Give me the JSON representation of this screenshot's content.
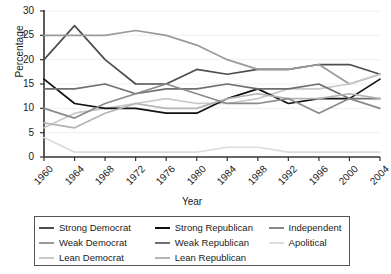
{
  "chart_data": {
    "type": "line",
    "title": "",
    "xlabel": "Year",
    "ylabel": "Percentage",
    "grid": true,
    "legend_position": "bottom",
    "xlim": [
      1960,
      2004
    ],
    "ylim": [
      0,
      30
    ],
    "yticks": [
      "0",
      "5",
      "10",
      "15",
      "20",
      "25",
      "30"
    ],
    "x": [
      1960,
      1964,
      1968,
      1972,
      1976,
      1980,
      1984,
      1988,
      1992,
      1996,
      2000,
      2004
    ],
    "xticks": [
      "1960",
      "1964",
      "1968",
      "1972",
      "1976",
      "1980",
      "1984",
      "1988",
      "1992",
      "1996",
      "2000",
      "2004"
    ],
    "series": [
      {
        "name": "Strong Democrat",
        "color": "#4d4d4d",
        "values": [
          20.0,
          27.0,
          20.0,
          15.0,
          15.0,
          18.0,
          17.0,
          18.0,
          18.0,
          19.0,
          19.0,
          17.0
        ]
      },
      {
        "name": "Weak Democrat",
        "color": "#9a9a9a",
        "values": [
          25.0,
          25.0,
          25.0,
          26.0,
          25.0,
          23.0,
          20.0,
          18.0,
          18.0,
          19.0,
          15.0,
          17.0
        ]
      },
      {
        "name": "Lean Democrat",
        "color": "#c9c9c9",
        "values": [
          6.0,
          9.0,
          10.0,
          11.0,
          12.0,
          11.0,
          11.0,
          12.0,
          14.0,
          14.0,
          15.0,
          17.0
        ]
      },
      {
        "name": "Strong Republican",
        "color": "#111111",
        "values": [
          16.0,
          11.0,
          10.0,
          10.0,
          9.0,
          9.0,
          12.0,
          14.0,
          11.0,
          12.0,
          12.0,
          16.0
        ]
      },
      {
        "name": "Weak Republican",
        "color": "#6f6f6f",
        "values": [
          14.0,
          14.0,
          15.0,
          13.0,
          14.0,
          14.0,
          15.0,
          14.0,
          14.0,
          15.0,
          12.0,
          12.0
        ]
      },
      {
        "name": "Lean Republican",
        "color": "#b4b4b4",
        "values": [
          7.0,
          6.0,
          9.0,
          11.0,
          10.0,
          10.0,
          12.0,
          13.0,
          12.0,
          12.0,
          13.0,
          12.0
        ]
      },
      {
        "name": "Independent",
        "color": "#8a8a8a",
        "values": [
          10.0,
          8.0,
          11.0,
          13.0,
          15.0,
          13.0,
          11.0,
          11.0,
          12.0,
          9.0,
          12.0,
          10.0
        ]
      },
      {
        "name": "Apolitical",
        "color": "#dcdcdc",
        "values": [
          4.0,
          1.0,
          1.0,
          1.0,
          1.0,
          1.0,
          2.0,
          2.0,
          1.0,
          1.0,
          1.0,
          1.0
        ]
      }
    ]
  },
  "legend": {
    "columns": [
      [
        {
          "label": "Strong Democrat",
          "color": "#4d4d4d"
        },
        {
          "label": "Weak Democrat",
          "color": "#9a9a9a"
        },
        {
          "label": "Lean Democrat",
          "color": "#c9c9c9"
        }
      ],
      [
        {
          "label": "Strong Republican",
          "color": "#111111"
        },
        {
          "label": "Weak Republican",
          "color": "#6f6f6f"
        },
        {
          "label": "Lean Republican",
          "color": "#b4b4b4"
        }
      ],
      [
        {
          "label": "Independent",
          "color": "#8a8a8a"
        },
        {
          "label": "Apolitical",
          "color": "#dcdcdc"
        }
      ]
    ]
  }
}
